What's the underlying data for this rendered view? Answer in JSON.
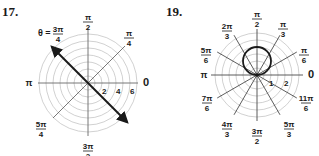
{
  "problems": [
    {
      "number": "17.",
      "center": [
        88,
        83
      ],
      "unit_px": 7,
      "grid_circles": [
        1,
        2,
        3,
        4,
        5,
        6,
        7
      ],
      "ray_angles_label": [
        {
          "num": "π",
          "den": "2",
          "pos": [
            88,
            14
          ]
        },
        {
          "num": "π",
          "den": "4",
          "pos": [
            129,
            30
          ]
        },
        {
          "text": "0",
          "pos": [
            146,
            86
          ]
        },
        {
          "text": "π",
          "pos": [
            29,
            86
          ]
        },
        {
          "num": "5π",
          "den": "4",
          "pos": [
            41,
            121
          ]
        },
        {
          "num": "3π",
          "den": "2",
          "pos": [
            88,
            143
          ]
        }
      ],
      "theta_label": {
        "prefix": "θ =",
        "num": "3π",
        "den": "4"
      },
      "radius_ticks": [
        "2",
        "4",
        "6"
      ],
      "highlighted_line": {
        "angle": "3π/4",
        "description": "line θ = 3π/4 with arrows both ends"
      }
    },
    {
      "number": "19.",
      "center": [
        257,
        75
      ],
      "unit_px": 14,
      "grid_circles": [
        0.5,
        1,
        1.5,
        2,
        2.5,
        3
      ],
      "ray_angles_label": [
        {
          "num": "π",
          "den": "2",
          "pos": [
            257,
            11
          ]
        },
        {
          "num": "π",
          "den": "3",
          "pos": [
            283,
            21
          ]
        },
        {
          "num": "2π",
          "den": "3",
          "pos": [
            227,
            23
          ]
        },
        {
          "num": "π",
          "den": "6",
          "pos": [
            304,
            47
          ]
        },
        {
          "num": "5π",
          "den": "6",
          "pos": [
            206,
            47
          ]
        },
        {
          "text": "0",
          "pos": [
            311,
            78
          ]
        },
        {
          "text": "π",
          "pos": [
            204,
            78
          ]
        },
        {
          "num": "7π",
          "den": "6",
          "pos": [
            207,
            95
          ]
        },
        {
          "num": "11π",
          "den": "6",
          "pos": [
            306,
            95
          ]
        },
        {
          "num": "4π",
          "den": "3",
          "pos": [
            227,
            121
          ]
        },
        {
          "num": "5π",
          "den": "3",
          "pos": [
            289,
            121
          ]
        },
        {
          "num": "3π",
          "den": "2",
          "pos": [
            257,
            128
          ]
        }
      ],
      "radius_ticks": [
        "1",
        "2"
      ],
      "curve": {
        "type": "circle",
        "equation": "r = 2 sin θ",
        "diameter_units": 2
      }
    }
  ]
}
